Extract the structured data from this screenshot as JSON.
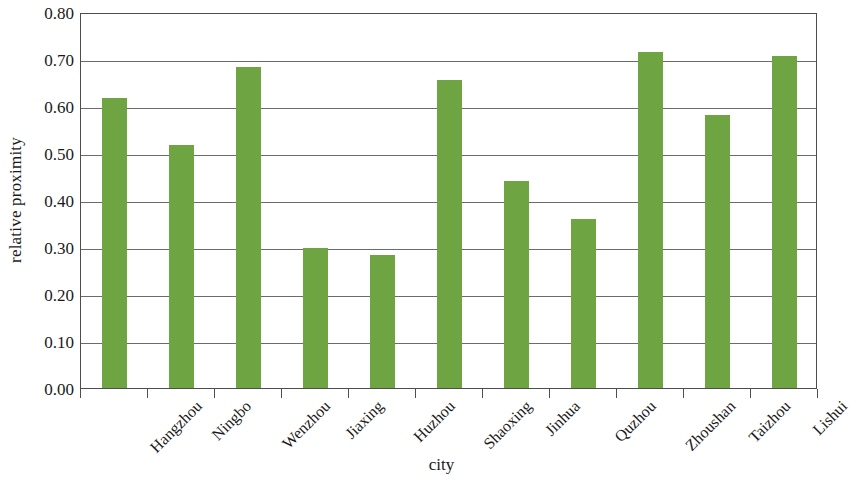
{
  "chart_data": {
    "type": "bar",
    "title": "",
    "xlabel": "city",
    "ylabel": "relative proximity",
    "categories": [
      "Hangzhou",
      "Ningbo",
      "Wenzhou",
      "Jiaxing",
      "Huzhou",
      "Shaoxing",
      "Jinhua",
      "Quzhou",
      "Zhoushan",
      "Taizhou",
      "Lishui"
    ],
    "values": [
      0.617,
      0.517,
      0.683,
      0.297,
      0.283,
      0.655,
      0.44,
      0.36,
      0.715,
      0.58,
      0.707
    ],
    "ylim": [
      0.0,
      0.8
    ],
    "ytick_step": 0.1,
    "ytick_labels": [
      "0.80",
      "0.70",
      "0.60",
      "0.50",
      "0.40",
      "0.30",
      "0.20",
      "0.10",
      "0.00"
    ],
    "ytick_values": [
      0.8,
      0.7,
      0.6,
      0.5,
      0.4,
      0.3,
      0.2,
      0.1,
      0.0
    ],
    "grid": true,
    "grid_axis": "y",
    "legend": false,
    "legend_position": "none",
    "bar_color": "#6FA442",
    "axis_color": "#4D4D4D",
    "gridline_color": "#6B6B6B",
    "background_color": "#FFFFFF",
    "xtick_label_rotation": 45
  }
}
